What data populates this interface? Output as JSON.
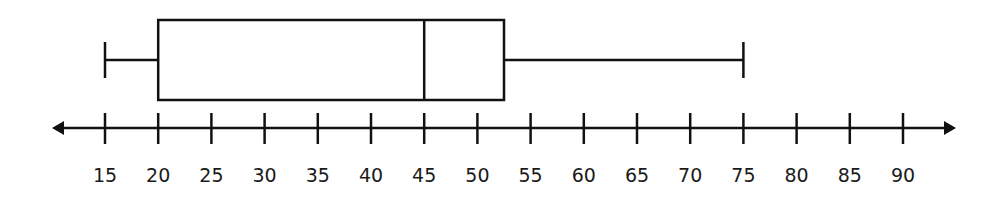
{
  "chart_data": {
    "type": "boxplot",
    "title": "",
    "xlabel": "",
    "ylabel": "",
    "orientation": "horizontal",
    "axis": {
      "min": 15,
      "max": 90,
      "step": 5,
      "ticks": [
        15,
        20,
        25,
        30,
        35,
        40,
        45,
        50,
        55,
        60,
        65,
        70,
        75,
        80,
        85,
        90
      ],
      "arrows": "both"
    },
    "box": {
      "min": 15,
      "q1": 20,
      "median": 45,
      "q3": 52.5,
      "max": 75
    },
    "colors": {
      "stroke": "#111111",
      "background": "#ffffff"
    }
  }
}
